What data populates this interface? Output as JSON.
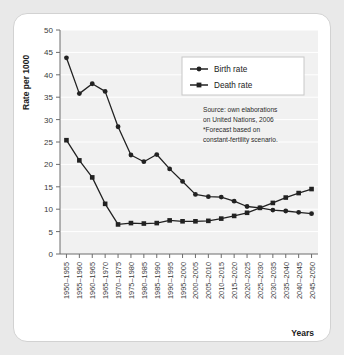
{
  "chart_data": {
    "type": "line",
    "title": "",
    "xlabel": "Years",
    "ylabel": "Rate per 1000",
    "ylim": [
      0,
      50
    ],
    "ytick_step": 5,
    "yticks": [
      0,
      5,
      10,
      15,
      20,
      25,
      30,
      35,
      40,
      45,
      50
    ],
    "grid": true,
    "legend_position": "top-right",
    "categories": [
      "1950–1955",
      "1955–1960",
      "1960–1965",
      "1965–1970",
      "1970–1975",
      "1975–1980",
      "1980–1985",
      "1985–1990",
      "1990–1995",
      "1995–2000",
      "2000–2005",
      "2005–2010",
      "2010–2015",
      "2015–2020",
      "2020–2025",
      "2025–2030",
      "2030–2035",
      "2035–2040",
      "2040–2045",
      "2045–2050"
    ],
    "series": [
      {
        "name": "Birth rate",
        "color": "#222222",
        "marker": "circle",
        "values": [
          43.8,
          35.8,
          38.0,
          36.3,
          28.4,
          22.1,
          20.6,
          22.2,
          19.0,
          16.2,
          13.3,
          12.8,
          12.7,
          11.8,
          10.6,
          10.3,
          9.8,
          9.6,
          9.3,
          9.0
        ]
      },
      {
        "name": "Death rate",
        "color": "#222222",
        "marker": "square",
        "values": [
          25.4,
          20.9,
          17.1,
          11.2,
          6.6,
          6.9,
          6.8,
          6.9,
          7.5,
          7.3,
          7.3,
          7.4,
          7.9,
          8.5,
          9.2,
          10.3,
          11.4,
          12.6,
          13.6,
          14.5
        ]
      }
    ],
    "annotations": [
      "Source: own elaborations",
      "on United Nations, 2006",
      "*Forecast based on",
      "constant-fertility scenario."
    ]
  },
  "legend": {
    "items": [
      {
        "label": "Birth rate"
      },
      {
        "label": "Death rate"
      }
    ]
  },
  "axes": {
    "y_title": "Rate per 1000",
    "x_title": "Years"
  }
}
